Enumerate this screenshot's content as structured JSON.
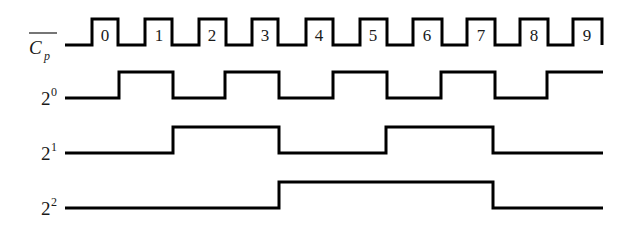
{
  "diagram": {
    "type": "timing-diagram",
    "colors": {
      "line": "#000000",
      "text": "#1a1a1a",
      "background": "#ffffff"
    },
    "signals": [
      {
        "id": "clk",
        "label_main": "C",
        "label_sub": "p",
        "overline": true,
        "pulse_labels": [
          "0",
          "1",
          "2",
          "3",
          "4",
          "5",
          "6",
          "7",
          "8",
          "9"
        ]
      },
      {
        "id": "q0",
        "label_base": "2",
        "label_exp": "0"
      },
      {
        "id": "q1",
        "label_base": "2",
        "label_exp": "1"
      },
      {
        "id": "q2",
        "label_base": "2",
        "label_exp": "2"
      }
    ],
    "waveforms": {
      "clk": "0 1 0 1 0 1 0 1 0 1 0 1 0 1 0 1 0 1 0 1",
      "q0": "0 1 0 1 0 1 0 1 0 1",
      "q1": "0 1 0 1 0",
      "q2": "0 1 0"
    },
    "counter_sequence": [
      0,
      1,
      2,
      3,
      4,
      5,
      6,
      7,
      0,
      1,
      2
    ]
  }
}
